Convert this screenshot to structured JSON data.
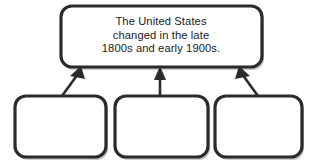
{
  "diagram": {
    "type": "hierarchy-web-organizer",
    "title_box": {
      "name": "main-idea-box",
      "text_lines": [
        "The United States",
        "changed in the late",
        "1800s and early 1900s."
      ],
      "text": "The United States changed in the late 1800s and early 1900s.",
      "filled": false,
      "border_color": "#2b2b2b",
      "fill_color": "#ffffff"
    },
    "detail_boxes": [
      {
        "name": "detail-box-1",
        "text": "",
        "filled": false
      },
      {
        "name": "detail-box-2",
        "text": "",
        "filled": false
      },
      {
        "name": "detail-box-3",
        "text": "",
        "filled": false
      }
    ],
    "connectors": [
      {
        "name": "arrow-from-detail-1",
        "direction": "up-right",
        "style": "solid-arrow"
      },
      {
        "name": "arrow-from-detail-2",
        "direction": "up",
        "style": "solid-arrow"
      },
      {
        "name": "arrow-from-detail-3",
        "direction": "up-left",
        "style": "solid-arrow"
      }
    ],
    "colors": {
      "stroke": "#2b2b2b",
      "fill": "#ffffff",
      "shadow": "#c9c9c9",
      "text": "#1a1a1a",
      "background": "#ffffff"
    }
  }
}
